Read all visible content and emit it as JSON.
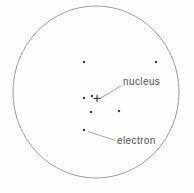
{
  "diagram": {
    "labels": {
      "nucleus": "nucleus",
      "electron": "electron"
    },
    "colors": {
      "background": "#fefefe",
      "outline": "#9b9b9b",
      "dot": "#3a3a3a",
      "marker": "#2f2f2f",
      "leader_line": "#8c8c8c",
      "text": "#4d4d4d"
    },
    "boundary_circle": {
      "cx": 96,
      "cy": 92,
      "rx": 83,
      "ry": 86
    },
    "electron_dots": [
      {
        "x": 84,
        "y": 62
      },
      {
        "x": 156,
        "y": 62
      },
      {
        "x": 84,
        "y": 98
      },
      {
        "x": 92,
        "y": 96
      },
      {
        "x": 119,
        "y": 111
      },
      {
        "x": 91,
        "y": 112
      },
      {
        "x": 84,
        "y": 130
      }
    ],
    "nucleus_marker": {
      "symbol": "plus",
      "x": 97,
      "y": 98.5,
      "arm": 3.5
    },
    "leader_lines": {
      "nucleus": {
        "x1": 121.5,
        "y1": 85.5,
        "x2": 100,
        "y2": 98.5
      },
      "electron": {
        "x1": 88,
        "y1": 131.5,
        "x2": 115.5,
        "y2": 140.5
      }
    }
  }
}
